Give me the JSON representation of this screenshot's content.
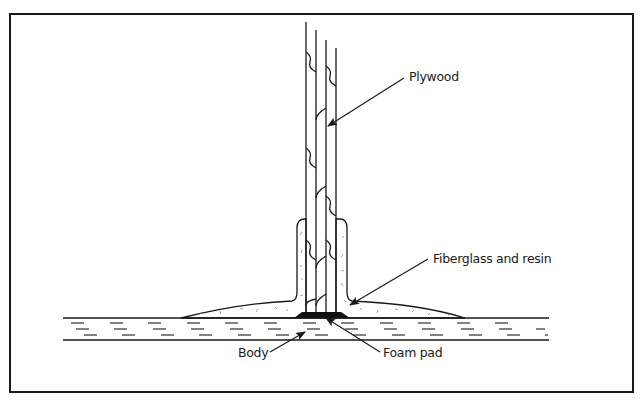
{
  "diagram": {
    "labels": {
      "plywood": "Plywood",
      "fiberglass": "Fiberglass and resin",
      "body": "Body",
      "foam_pad": "Foam pad"
    },
    "colors": {
      "line": "#1a1a1a",
      "background": "#ffffff",
      "fill": "#ffffff"
    }
  }
}
